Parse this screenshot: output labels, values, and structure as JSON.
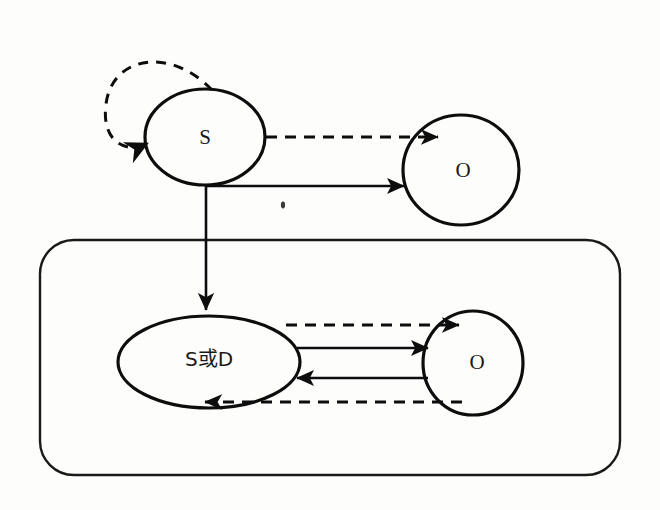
{
  "diagram": {
    "background_color": "#fdfdfc",
    "stroke_color": "#0d0d0d",
    "nodes": [
      {
        "id": "s_top",
        "label": "S",
        "shape": "ellipse",
        "cx": 205,
        "cy": 137,
        "rx": 60,
        "ry": 48
      },
      {
        "id": "o_top",
        "label": "O",
        "shape": "ellipse",
        "cx": 461,
        "cy": 170,
        "rx": 58,
        "ry": 55
      },
      {
        "id": "sd_bot",
        "label": "S或D",
        "shape": "ellipse",
        "cx": 209,
        "cy": 362,
        "rx": 91,
        "ry": 46
      },
      {
        "id": "o_bot",
        "label": "O",
        "shape": "ellipse",
        "cx": 473,
        "cy": 363,
        "rx": 50,
        "ry": 52
      }
    ],
    "group": {
      "id": "group_box",
      "label": "",
      "x": 40,
      "y": 240,
      "width": 580,
      "height": 235,
      "radius": 34
    },
    "edges": [
      {
        "id": "e_self_loop",
        "from": "s_top",
        "to": "s_top",
        "style": "dashed",
        "direction": "counterclockwise-self-loop"
      },
      {
        "id": "e_s_to_o_dashed",
        "from": "s_top",
        "to": "o_top",
        "style": "dashed",
        "direction": "right"
      },
      {
        "id": "e_s_to_o_solid",
        "from": "s_top",
        "to": "o_top",
        "style": "solid",
        "direction": "right"
      },
      {
        "id": "e_s_to_sd",
        "from": "s_top",
        "to": "sd_bot",
        "style": "solid",
        "direction": "down"
      },
      {
        "id": "e_sd_to_o_dashed",
        "from": "sd_bot",
        "to": "o_bot",
        "style": "dashed",
        "direction": "right"
      },
      {
        "id": "e_sd_to_o_solid",
        "from": "sd_bot",
        "to": "o_bot",
        "style": "solid",
        "direction": "right"
      },
      {
        "id": "e_o_to_sd_solid",
        "from": "o_bot",
        "to": "sd_bot",
        "style": "solid",
        "direction": "left"
      },
      {
        "id": "e_o_to_sd_dashed",
        "from": "o_bot",
        "to": "sd_bot",
        "style": "dashed",
        "direction": "left"
      }
    ]
  }
}
